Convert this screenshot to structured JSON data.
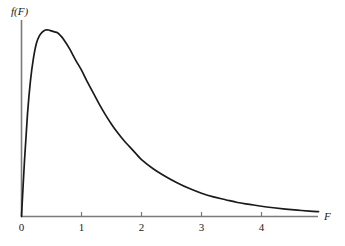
{
  "chart_data": {
    "type": "line",
    "title": "",
    "subtitle": "",
    "xlabel": "F",
    "ylabel": "f(F)",
    "legend": [],
    "grid": false,
    "xlim": [
      0,
      4.95
    ],
    "ylim": [
      0,
      1.05
    ],
    "xticks": [
      0,
      1,
      2,
      3,
      4
    ],
    "xtick_labels": [
      "0",
      "1",
      "2",
      "3",
      "4"
    ],
    "yticks": [],
    "ytick_labels": [],
    "annotations": [],
    "series": [
      {
        "name": "f(F)",
        "color": "#1a1a1a",
        "x": [
          0.0,
          0.05,
          0.1,
          0.15,
          0.2,
          0.25,
          0.3,
          0.35,
          0.4,
          0.45,
          0.5,
          0.55,
          0.6,
          0.65,
          0.7,
          0.8,
          0.9,
          1.0,
          1.1,
          1.2,
          1.3,
          1.4,
          1.5,
          1.6,
          1.7,
          1.8,
          1.9,
          2.0,
          2.2,
          2.4,
          2.6,
          2.8,
          3.0,
          3.2,
          3.4,
          3.6,
          3.8,
          4.0,
          4.2,
          4.4,
          4.6,
          4.8,
          4.95
        ],
        "y": [
          0.0,
          0.3,
          0.55,
          0.73,
          0.85,
          0.93,
          0.97,
          0.99,
          1.0,
          1.0,
          0.995,
          0.99,
          0.985,
          0.97,
          0.95,
          0.9,
          0.84,
          0.785,
          0.72,
          0.66,
          0.6,
          0.545,
          0.495,
          0.45,
          0.41,
          0.375,
          0.34,
          0.305,
          0.255,
          0.215,
          0.18,
          0.15,
          0.125,
          0.105,
          0.09,
          0.075,
          0.065,
          0.055,
          0.047,
          0.04,
          0.034,
          0.029,
          0.026
        ]
      }
    ]
  },
  "labels": {
    "y_axis": "f(F)",
    "x_axis": "F",
    "ticks": [
      "0",
      "1",
      "2",
      "3",
      "4"
    ]
  },
  "colors": {
    "curve": "#1a1a1a",
    "axis": "#7a7a7a",
    "text": "#1a1a1a",
    "background": "#ffffff"
  }
}
